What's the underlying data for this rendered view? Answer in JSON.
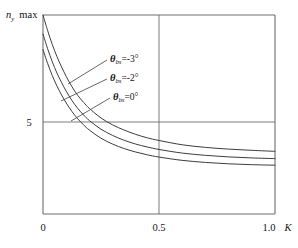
{
  "chart_data": {
    "type": "line",
    "title": "",
    "subtitle": "",
    "ylabel": "n_y max",
    "ylabel_parts": {
      "symbol": "n",
      "subscript": "y",
      "suffix": "max"
    },
    "xlabel": "K",
    "xlim": [
      0,
      1.0
    ],
    "ylim": [
      0,
      11.5
    ],
    "grid": true,
    "grid_description": "one horizontal gridline at y=5 and one vertical gridline at x=0.5",
    "legend_position": "inline annotations with leader lines",
    "x_ticks": [
      "0",
      "0.5",
      "1.0"
    ],
    "x_tick_values": [
      0,
      0.5,
      1.0
    ],
    "y_ticks": [
      "5"
    ],
    "y_tick_values": [
      5
    ],
    "x": [
      0.0,
      0.02,
      0.04,
      0.06,
      0.08,
      0.1,
      0.125,
      0.15,
      0.175,
      0.2,
      0.25,
      0.3,
      0.35,
      0.4,
      0.45,
      0.5,
      0.6,
      0.7,
      0.8,
      0.9,
      1.0
    ],
    "series": [
      {
        "name": "theta_bs = -3 deg",
        "label": "θbs=-3°",
        "theta_bs_deg": -3,
        "color": "#3d3d3d",
        "values": [
          11.5,
          10.6,
          9.8,
          9.1,
          8.5,
          7.95,
          7.35,
          6.85,
          6.45,
          6.1,
          5.55,
          5.15,
          4.85,
          4.6,
          4.4,
          4.25,
          4.0,
          3.85,
          3.75,
          3.68,
          3.62
        ]
      },
      {
        "name": "theta_bs = -2 deg",
        "label": "θbs=-2°",
        "theta_bs_deg": -2,
        "color": "#3d3d3d",
        "values": [
          10.4,
          9.55,
          8.8,
          8.15,
          7.6,
          7.1,
          6.55,
          6.1,
          5.72,
          5.4,
          4.9,
          4.54,
          4.26,
          4.04,
          3.87,
          3.73,
          3.52,
          3.39,
          3.3,
          3.24,
          3.2
        ]
      },
      {
        "name": "theta_bs = 0 deg",
        "label": "θbs=0°",
        "theta_bs_deg": 0,
        "color": "#3d3d3d",
        "values": [
          9.5,
          8.7,
          8.0,
          7.4,
          6.88,
          6.42,
          5.92,
          5.5,
          5.15,
          4.85,
          4.38,
          4.04,
          3.78,
          3.58,
          3.42,
          3.29,
          3.1,
          2.98,
          2.9,
          2.85,
          2.82
        ]
      }
    ],
    "annotations": [
      {
        "theta_symbol": "θ",
        "subscript": "bs",
        "rest": "=-3°",
        "full": "θbs=-3°",
        "text_x": 110,
        "text_y": 62,
        "leader_from_x": 107,
        "leader_from_y": 60,
        "leader_to_x": 68,
        "leader_to_y": 84
      },
      {
        "theta_symbol": "θ",
        "subscript": "bs",
        "rest": "=-2°",
        "full": "θbs=-2°",
        "text_x": 110,
        "text_y": 81,
        "leader_from_x": 107,
        "leader_from_y": 79,
        "leader_to_x": 61,
        "leader_to_y": 101
      },
      {
        "theta_symbol": "θ",
        "subscript": "bs",
        "rest": "=0°",
        "full": "θbs=0°",
        "text_x": 113,
        "text_y": 100,
        "leader_from_x": 110,
        "leader_from_y": 98,
        "leader_to_x": 71,
        "leader_to_y": 121
      }
    ]
  },
  "axes": {
    "y_title_symbol": "n",
    "y_title_subscript": "y",
    "y_title_suffix": "max",
    "x_title": "K",
    "y_tick_5": "5",
    "x_tick_0": "0",
    "x_tick_05": "0.5",
    "x_tick_10": "1.0"
  },
  "colors": {
    "frame": "#6e6e6e",
    "grid": "#6e6e6e",
    "curve": "#3d3d3d",
    "leader": "#4a4a4a",
    "text": "#141414",
    "background": "#ffffff"
  }
}
